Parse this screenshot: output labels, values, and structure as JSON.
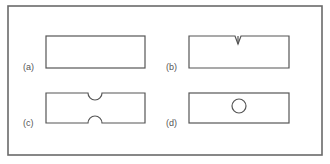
{
  "diagram": {
    "frame": {
      "x": 8,
      "y": 6,
      "width": 314,
      "height": 149,
      "stroke": "#6a6a6a"
    },
    "stroke_color": "#555555",
    "panels": [
      {
        "id": "a",
        "label": "(a)",
        "feature": "plain rectangle",
        "rect": {
          "x": 46,
          "y": 36,
          "w": 99,
          "h": 32
        }
      },
      {
        "id": "b",
        "label": "(b)",
        "feature": "sharp V-notch on top edge",
        "rect": {
          "x": 189,
          "y": 36,
          "w": 100,
          "h": 32
        },
        "notch": {
          "cx": 238,
          "depth": 8,
          "half_width": 3
        }
      },
      {
        "id": "c",
        "label": "(c)",
        "feature": "semicircular notches on top and bottom edges",
        "rect": {
          "x": 46,
          "y": 93,
          "w": 99,
          "h": 30
        },
        "notch": {
          "cx": 95,
          "r": 7
        }
      },
      {
        "id": "d",
        "label": "(d)",
        "feature": "central circular hole",
        "rect": {
          "x": 189,
          "y": 93,
          "w": 100,
          "h": 30
        },
        "hole": {
          "cx": 239,
          "cy": 106,
          "r": 7
        }
      }
    ]
  }
}
